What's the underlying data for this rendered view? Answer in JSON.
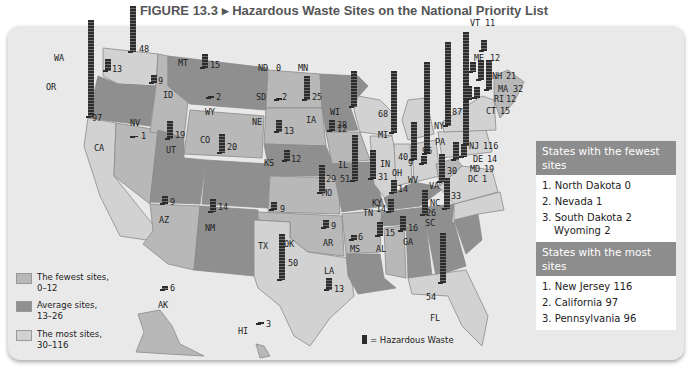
{
  "title": "FIGURE 13.3 ▸ Hazardous Waste Sites on the National Priority List",
  "legend": {
    "ranges": [
      {
        "label": "The fewest sites,",
        "range": "0–12",
        "color": "#b8b8b8"
      },
      {
        "label": "Average sites,",
        "range": "13–26",
        "color": "#8f8f8f"
      },
      {
        "label": "The most sites,",
        "range": "30–116",
        "color": "#d2d2d2"
      }
    ],
    "symbol_label": "= Hazardous Waste",
    "symbol_icon": "factory-bar-icon"
  },
  "states": [
    {
      "abbr": "WA",
      "sites": 48
    },
    {
      "abbr": "OR",
      "sites": 13
    },
    {
      "abbr": "CA",
      "sites": 97
    },
    {
      "abbr": "ID",
      "sites": 9
    },
    {
      "abbr": "NV",
      "sites": 1
    },
    {
      "abbr": "MT",
      "sites": 15
    },
    {
      "abbr": "WY",
      "sites": 2
    },
    {
      "abbr": "UT",
      "sites": 19
    },
    {
      "abbr": "CO",
      "sites": 20
    },
    {
      "abbr": "AZ",
      "sites": 9
    },
    {
      "abbr": "NM",
      "sites": 14
    },
    {
      "abbr": "ND",
      "sites": 0
    },
    {
      "abbr": "SD",
      "sites": 2
    },
    {
      "abbr": "NE",
      "sites": 13
    },
    {
      "abbr": "KS",
      "sites": 12
    },
    {
      "abbr": "OK",
      "sites": 9
    },
    {
      "abbr": "TX",
      "sites": 50
    },
    {
      "abbr": "MN",
      "sites": 25
    },
    {
      "abbr": "IA",
      "sites": 12
    },
    {
      "abbr": "MO",
      "sites": 29
    },
    {
      "abbr": "AR",
      "sites": 9
    },
    {
      "abbr": "LA",
      "sites": 13
    },
    {
      "abbr": "WI",
      "sites": 38
    },
    {
      "abbr": "IL",
      "sites": 51
    },
    {
      "abbr": "MI",
      "sites": 68
    },
    {
      "abbr": "IN",
      "sites": 31
    },
    {
      "abbr": "OH",
      "sites": 40
    },
    {
      "abbr": "KY",
      "sites": 14
    },
    {
      "abbr": "TN",
      "sites": 14
    },
    {
      "abbr": "MS",
      "sites": 6
    },
    {
      "abbr": "AL",
      "sites": 15
    },
    {
      "abbr": "GA",
      "sites": 16
    },
    {
      "abbr": "FL",
      "sites": 54
    },
    {
      "abbr": "SC",
      "sites": 26
    },
    {
      "abbr": "NC",
      "sites": 33
    },
    {
      "abbr": "VA",
      "sites": 30
    },
    {
      "abbr": "WV",
      "sites": 9
    },
    {
      "abbr": "PA",
      "sites": 96
    },
    {
      "abbr": "NY",
      "sites": 87
    },
    {
      "abbr": "VT",
      "sites": 11
    },
    {
      "abbr": "ME",
      "sites": 12
    },
    {
      "abbr": "NH",
      "sites": 21
    },
    {
      "abbr": "MA",
      "sites": 32
    },
    {
      "abbr": "RI",
      "sites": 12
    },
    {
      "abbr": "CT",
      "sites": 15
    },
    {
      "abbr": "NJ",
      "sites": 116
    },
    {
      "abbr": "DE",
      "sites": 14
    },
    {
      "abbr": "MD",
      "sites": 19
    },
    {
      "abbr": "DC",
      "sites": 1
    },
    {
      "abbr": "AK",
      "sites": 6
    },
    {
      "abbr": "HI",
      "sites": 3
    }
  ],
  "sidebar": {
    "fewest_header": "States with the fewest sites",
    "fewest": [
      "1. North Dakota 0",
      "2. Nevada 1",
      "3. South Dakota 2",
      "Wyoming 2"
    ],
    "most_header": "States with the most sites",
    "most": [
      "1. New Jersey 116",
      "2. California 97",
      "3. Pennsylvania 96"
    ]
  }
}
